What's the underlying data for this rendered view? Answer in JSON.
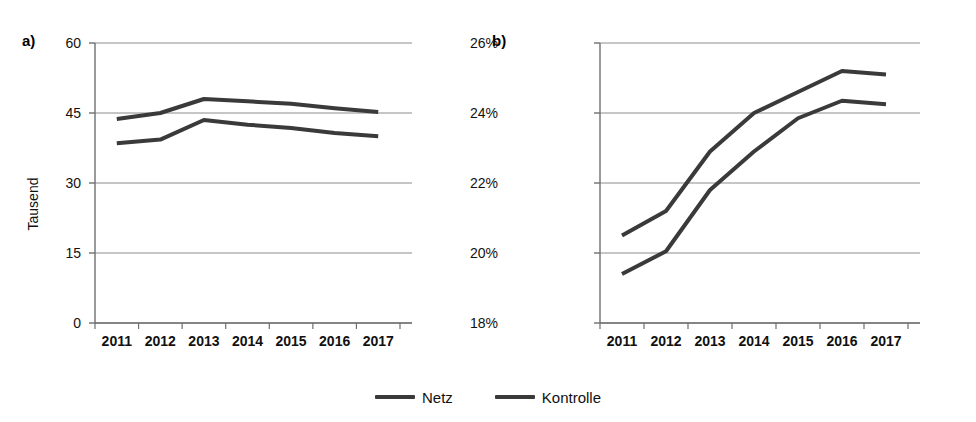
{
  "figure": {
    "panels": [
      {
        "letter": "a)",
        "ylabel": "Tausend",
        "yticks": [
          "60",
          "45",
          "30",
          "15",
          "0"
        ],
        "xticks": [
          "2011",
          "2012",
          "2013",
          "2014",
          "2015",
          "2016",
          "2017"
        ]
      },
      {
        "letter": "b)",
        "ylabel": "",
        "yticks": [
          "26%",
          "24%",
          "22%",
          "20%",
          "18%"
        ],
        "xticks": [
          "2011",
          "2012",
          "2013",
          "2014",
          "2015",
          "2016",
          "2017"
        ]
      }
    ]
  },
  "legend": {
    "position": "bottom-center",
    "items": [
      {
        "label": "Netz",
        "color": "#3a3a3a"
      },
      {
        "label": "Kontrolle",
        "color": "#3a3a3a"
      }
    ]
  },
  "chart_data": [
    {
      "type": "line",
      "panel": "a)",
      "title": "",
      "xlabel": "",
      "ylabel": "Tausend",
      "categories": [
        "2011",
        "2012",
        "2013",
        "2014",
        "2015",
        "2016",
        "2017"
      ],
      "ylim": [
        0,
        60
      ],
      "yticks": [
        0,
        15,
        30,
        45,
        60
      ],
      "grid": true,
      "series": [
        {
          "name": "Netz",
          "color": "#3a3a3a",
          "values": [
            43.7,
            45.0,
            48.0,
            47.5,
            47.0,
            46.0,
            45.2
          ]
        },
        {
          "name": "Kontrolle",
          "color": "#3a3a3a",
          "values": [
            38.5,
            39.3,
            43.5,
            42.5,
            41.8,
            40.7,
            40.0
          ]
        }
      ]
    },
    {
      "type": "line",
      "panel": "b)",
      "title": "",
      "xlabel": "",
      "ylabel": "",
      "categories": [
        "2011",
        "2012",
        "2013",
        "2014",
        "2015",
        "2016",
        "2017"
      ],
      "ylim": [
        18,
        26
      ],
      "yticks": [
        18,
        20,
        22,
        24,
        26
      ],
      "ytick_format": "percent",
      "grid": true,
      "series": [
        {
          "name": "Netz",
          "color": "#3a3a3a",
          "values": [
            20.5,
            21.2,
            22.9,
            24.0,
            24.6,
            25.2,
            25.1
          ]
        },
        {
          "name": "Kontrolle",
          "color": "#3a3a3a",
          "values": [
            19.4,
            20.05,
            21.8,
            22.9,
            23.85,
            24.35,
            24.25
          ]
        }
      ]
    }
  ]
}
